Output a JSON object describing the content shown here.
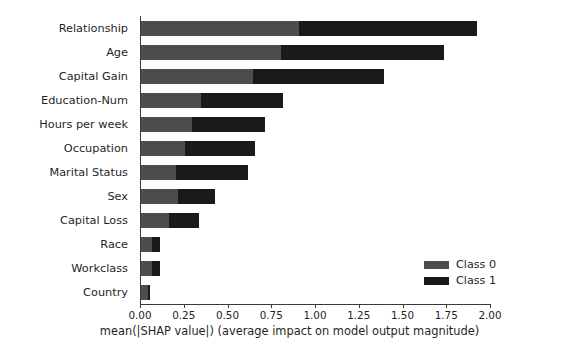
{
  "chart_data": {
    "type": "bar",
    "orientation": "horizontal",
    "stacked": true,
    "title": "",
    "subtitle": "",
    "xlabel": "mean(|SHAP value|) (average impact on model output magnitude)",
    "ylabel": "",
    "xlim": [
      0.0,
      2.0
    ],
    "xticks": [
      "0.00",
      "0.25",
      "0.50",
      "0.75",
      "1.00",
      "1.25",
      "1.50",
      "1.75",
      "2.00"
    ],
    "xtick_values": [
      0.0,
      0.25,
      0.5,
      0.75,
      1.0,
      1.25,
      1.5,
      1.75,
      2.0
    ],
    "grid": false,
    "legend_position": "lower right",
    "categories": [
      "Relationship",
      "Age",
      "Capital Gain",
      "Education-Num",
      "Hours per week",
      "Occupation",
      "Marital Status",
      "Sex",
      "Capital Loss",
      "Race",
      "Workclass",
      "Country"
    ],
    "series": [
      {
        "name": "Class 0",
        "color": "#4d4d4d",
        "values": [
          0.9,
          0.8,
          0.64,
          0.34,
          0.29,
          0.25,
          0.2,
          0.21,
          0.16,
          0.06,
          0.06,
          0.04
        ]
      },
      {
        "name": "Class 1",
        "color": "#1a1a1a",
        "values": [
          1.02,
          0.93,
          0.75,
          0.47,
          0.42,
          0.4,
          0.41,
          0.21,
          0.17,
          0.05,
          0.05,
          0.01
        ]
      }
    ],
    "totals": [
      1.92,
      1.73,
      1.39,
      0.81,
      0.71,
      0.65,
      0.61,
      0.42,
      0.33,
      0.11,
      0.11,
      0.05
    ],
    "legend": [
      {
        "label": "Class 0",
        "color": "#4d4d4d"
      },
      {
        "label": "Class 1",
        "color": "#1a1a1a"
      }
    ],
    "colors": {
      "class0": "#4d4d4d",
      "class1": "#1a1a1a",
      "axis": "#3a3a3a",
      "text": "#1f1f1f",
      "background": "#ffffff"
    }
  }
}
